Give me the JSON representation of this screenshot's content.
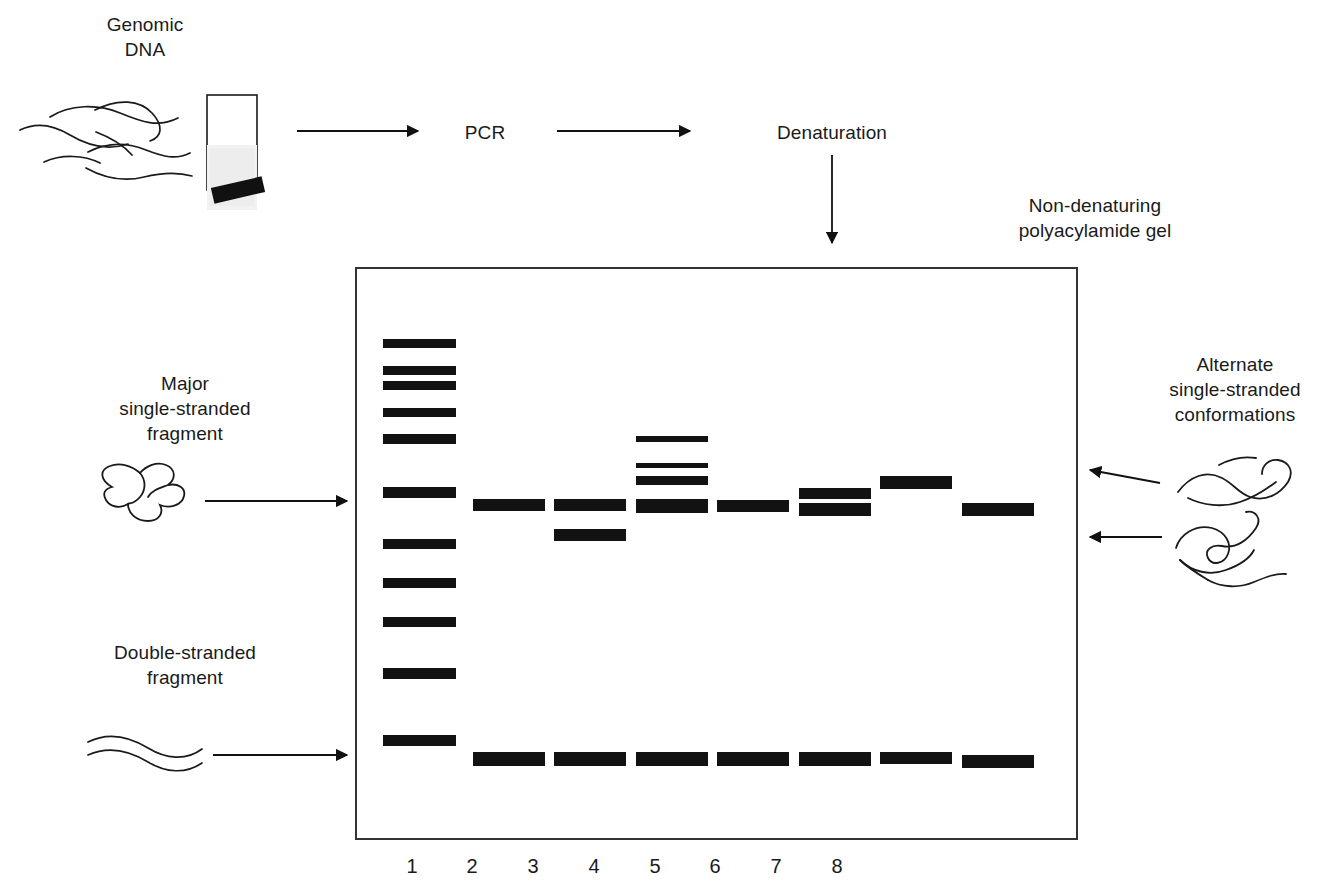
{
  "figure": {
    "title_labels": {
      "genomic_dna": "Genomic\nDNA",
      "pcr": "PCR",
      "denaturation": "Denaturation",
      "gel_type": "Non-denaturing\npolyacylamide gel",
      "major_fragment": "Major\nsingle-stranded\nfragment",
      "double_stranded": "Double-stranded\nfragment",
      "alternate_conformations": "Alternate\nsingle-stranded\nconformations"
    },
    "colors": {
      "band": "#121212",
      "gel_border": "#333333",
      "text": "#1a1a1a",
      "background": "#ffffff"
    }
  },
  "gel": {
    "box": {
      "x": 355,
      "y": 267,
      "width": 723,
      "height": 573
    },
    "lane_numbers": [
      "1",
      "2",
      "3",
      "4",
      "5",
      "6",
      "7",
      "8"
    ],
    "lane_number_y": 856,
    "lane_centers": [
      412,
      472,
      533,
      594,
      655,
      715,
      776,
      837
    ],
    "lanes": [
      {
        "lane": "1",
        "name": "ladder",
        "bands": [
          {
            "y": 339,
            "height": 9,
            "x": 383,
            "width": 73
          },
          {
            "y": 366,
            "height": 9,
            "x": 383,
            "width": 73
          },
          {
            "y": 381,
            "height": 9,
            "x": 383,
            "width": 73
          },
          {
            "y": 408,
            "height": 9,
            "x": 383,
            "width": 73
          },
          {
            "y": 434,
            "height": 10,
            "x": 383,
            "width": 73
          },
          {
            "y": 487,
            "height": 11,
            "x": 383,
            "width": 73
          },
          {
            "y": 539,
            "height": 10,
            "x": 383,
            "width": 73
          },
          {
            "y": 578,
            "height": 10,
            "x": 383,
            "width": 73
          },
          {
            "y": 617,
            "height": 10,
            "x": 383,
            "width": 73
          },
          {
            "y": 668,
            "height": 11,
            "x": 383,
            "width": 73
          },
          {
            "y": 735,
            "height": 11,
            "x": 383,
            "width": 73
          }
        ]
      },
      {
        "lane": "2",
        "bands": [
          {
            "y": 499,
            "height": 12,
            "x": 473,
            "width": 72
          },
          {
            "y": 752,
            "height": 14,
            "x": 473,
            "width": 72
          }
        ]
      },
      {
        "lane": "3",
        "bands": [
          {
            "y": 499,
            "height": 12,
            "x": 554,
            "width": 72
          },
          {
            "y": 529,
            "height": 12,
            "x": 554,
            "width": 72
          },
          {
            "y": 752,
            "height": 14,
            "x": 554,
            "width": 72
          }
        ]
      },
      {
        "lane": "4",
        "bands": [
          {
            "y": 436,
            "height": 6,
            "x": 636,
            "width": 72
          },
          {
            "y": 463,
            "height": 5,
            "x": 636,
            "width": 72
          },
          {
            "y": 476,
            "height": 9,
            "x": 636,
            "width": 72
          },
          {
            "y": 499,
            "height": 14,
            "x": 636,
            "width": 72
          },
          {
            "y": 752,
            "height": 14,
            "x": 636,
            "width": 72
          }
        ]
      },
      {
        "lane": "5",
        "bands": [
          {
            "y": 500,
            "height": 12,
            "x": 717,
            "width": 72
          },
          {
            "y": 752,
            "height": 14,
            "x": 717,
            "width": 72
          }
        ]
      },
      {
        "lane": "6",
        "bands": [
          {
            "y": 488,
            "height": 11,
            "x": 799,
            "width": 72
          },
          {
            "y": 503,
            "height": 13,
            "x": 799,
            "width": 72
          },
          {
            "y": 752,
            "height": 14,
            "x": 799,
            "width": 72
          }
        ]
      },
      {
        "lane": "7",
        "bands": [
          {
            "y": 476,
            "height": 13,
            "x": 880,
            "width": 72
          },
          {
            "y": 752,
            "height": 12,
            "x": 880,
            "width": 72
          }
        ]
      },
      {
        "lane": "8",
        "bands": [
          {
            "y": 503,
            "height": 13,
            "x": 962,
            "width": 72
          },
          {
            "y": 755,
            "height": 13,
            "x": 962,
            "width": 72
          }
        ]
      }
    ]
  }
}
